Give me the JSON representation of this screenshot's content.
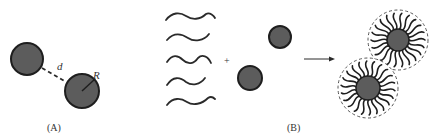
{
  "figure": {
    "panels": [
      {
        "id": "A",
        "caption": "(A)",
        "labels": {
          "distance": "d",
          "radius": "R"
        },
        "particles": [
          {
            "cx": 27,
            "cy": 59,
            "r": 16
          },
          {
            "cx": 82,
            "cy": 91,
            "r": 17
          }
        ]
      },
      {
        "id": "B",
        "caption": "(B)",
        "operator": "+",
        "chains_count": 5,
        "bare_particles": [
          {
            "cx": 280,
            "cy": 37,
            "r": 11
          },
          {
            "cx": 250,
            "cy": 78,
            "r": 12
          }
        ],
        "coated_particles": [
          {
            "cx": 398,
            "cy": 40,
            "core_r": 11,
            "shell_r": 30
          },
          {
            "cx": 368,
            "cy": 88,
            "core_r": 12,
            "shell_r": 30
          }
        ]
      }
    ],
    "colors": {
      "particle_fill": "#5c5c5c",
      "particle_stroke": "#1e1e1e",
      "line": "#2a2a2a",
      "dashed_shell": "#555555"
    }
  }
}
